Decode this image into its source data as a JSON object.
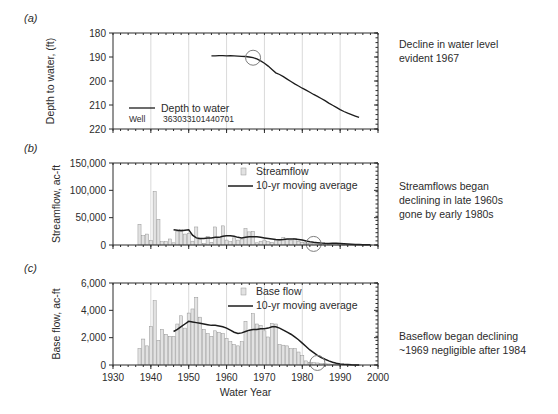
{
  "figure": {
    "panel_labels": {
      "a": "(a)",
      "b": "(b)",
      "c": "(c)"
    },
    "xlabel": "Water Year"
  },
  "annotations": {
    "a_line1": "Decline in water level",
    "a_line2": "evident 1967",
    "b_line1": "Streamflows began",
    "b_line2": "declining in late 1960s",
    "b_line3": "gone by early 1980s",
    "c_line1": "Baseflow began declining",
    "c_line2": "~1969 negligible after 1984"
  },
  "legends": {
    "a_series": "Depth to water",
    "a_well_label": "Well",
    "a_well_id": "363033101440701",
    "b_bars": "Streamflow",
    "b_line": "10-yr moving average",
    "c_bars": "Base flow",
    "c_line": "10-yr moving average"
  },
  "colors": {
    "bar_fill": "#e2e2e2",
    "bar_stroke": "#8d8d8d",
    "line": "#1d1d1d",
    "grid": "#c9c9c9",
    "marker_circle": "#7e7e7e"
  },
  "chart_data": [
    {
      "id": "panel-a",
      "type": "line",
      "title": "",
      "xlabel": "Water Year",
      "ylabel": "Depth to water, (ft)",
      "xlim": [
        1930,
        2000
      ],
      "ylim": [
        180,
        220
      ],
      "y_inverted": true,
      "xticks": [
        1930,
        1940,
        1950,
        1960,
        1970,
        1980,
        1990,
        2000
      ],
      "yticks": [
        180,
        190,
        200,
        210,
        220
      ],
      "grid": "vertical",
      "legend": "inside-lower-left",
      "marker_circle_x": 1967,
      "marker_circle_y": 190.3,
      "series": [
        {
          "name": "Depth to water",
          "x": [
            1956,
            1957,
            1958,
            1959,
            1960,
            1961,
            1962,
            1963,
            1964,
            1965,
            1966,
            1967,
            1968,
            1969,
            1970,
            1971,
            1972,
            1973,
            1974,
            1975,
            1976,
            1977,
            1978,
            1979,
            1980,
            1981,
            1982,
            1983,
            1984,
            1985,
            1986,
            1987,
            1988,
            1989,
            1990,
            1991,
            1992,
            1993,
            1994,
            1995
          ],
          "values": [
            189.5,
            189.5,
            189.4,
            189.4,
            189.5,
            189.4,
            189.5,
            189.6,
            189.7,
            189.8,
            190.0,
            190.3,
            190.8,
            191.6,
            192.6,
            193.8,
            195.2,
            196.6,
            197.3,
            198.2,
            199.2,
            200.2,
            201.2,
            202.1,
            203.0,
            203.8,
            204.7,
            205.6,
            206.4,
            207.3,
            208.2,
            209.2,
            210.1,
            211.0,
            211.9,
            212.7,
            213.4,
            214.0,
            214.6,
            215.2
          ]
        }
      ]
    },
    {
      "id": "panel-b",
      "type": "bar",
      "title": "",
      "xlabel": "Water Year",
      "ylabel": "Streamflow, ac-ft",
      "xlim": [
        1930,
        2000
      ],
      "ylim": [
        0,
        150000
      ],
      "xticks": [
        1930,
        1940,
        1950,
        1960,
        1970,
        1980,
        1990,
        2000
      ],
      "yticks": [
        0,
        50000,
        100000,
        150000
      ],
      "grid": "vertical",
      "legend": "inside-upper-right",
      "marker_circle_x": 1983,
      "marker_circle_y": 2000,
      "categories": [
        1937,
        1938,
        1939,
        1940,
        1941,
        1942,
        1943,
        1944,
        1945,
        1946,
        1947,
        1948,
        1949,
        1950,
        1951,
        1952,
        1953,
        1954,
        1955,
        1956,
        1957,
        1958,
        1959,
        1960,
        1961,
        1962,
        1963,
        1964,
        1965,
        1966,
        1967,
        1968,
        1969,
        1970,
        1971,
        1972,
        1973,
        1974,
        1975,
        1976,
        1977,
        1978,
        1979,
        1980,
        1981,
        1982,
        1983,
        1984,
        1985,
        1986,
        1987,
        1988,
        1989,
        1990,
        1991,
        1992,
        1993,
        1994,
        1995,
        1996,
        1997,
        1998
      ],
      "values": [
        38000,
        17000,
        20000,
        8000,
        98000,
        47000,
        6000,
        6000,
        11000,
        4000,
        25000,
        28000,
        20000,
        21000,
        7000,
        33000,
        10000,
        3000,
        16000,
        5000,
        33000,
        14000,
        35000,
        9000,
        6000,
        13000,
        9000,
        11000,
        30000,
        24000,
        25000,
        4000,
        7000,
        9000,
        6000,
        5000,
        9000,
        8000,
        14000,
        10000,
        9000,
        12000,
        6000,
        5000,
        4000,
        3000,
        2500,
        2000,
        1500,
        1200,
        1000,
        900,
        800,
        700,
        600,
        500,
        400,
        300,
        250,
        200,
        150,
        100
      ],
      "series": [
        {
          "name": "10-yr moving average",
          "x": [
            1946,
            1947,
            1948,
            1949,
            1950,
            1951,
            1952,
            1953,
            1954,
            1955,
            1956,
            1957,
            1958,
            1959,
            1960,
            1961,
            1962,
            1963,
            1964,
            1965,
            1966,
            1967,
            1968,
            1969,
            1970,
            1971,
            1972,
            1973,
            1974,
            1975,
            1976,
            1977,
            1978,
            1979,
            1980,
            1981,
            1982,
            1983,
            1984,
            1985,
            1986,
            1987,
            1988,
            1989,
            1990,
            1991,
            1992,
            1993,
            1994,
            1995,
            1996,
            1997,
            1998
          ],
          "values": [
            28000,
            27000,
            26000,
            27000,
            28000,
            18000,
            13000,
            12000,
            12000,
            13000,
            13000,
            14000,
            14000,
            16000,
            17000,
            17000,
            16000,
            14000,
            13000,
            14000,
            15000,
            15000,
            15000,
            14000,
            13000,
            12000,
            11000,
            10000,
            9500,
            10000,
            11000,
            11000,
            11000,
            10000,
            9000,
            7500,
            6000,
            5000,
            4200,
            3500,
            3000,
            2800,
            3000,
            3000,
            2800,
            2300,
            1800,
            1400,
            1000,
            700,
            500,
            400,
            300
          ]
        }
      ]
    },
    {
      "id": "panel-c",
      "type": "bar",
      "title": "",
      "xlabel": "Water Year",
      "ylabel": "Base flow, ac-ft",
      "xlim": [
        1930,
        2000
      ],
      "ylim": [
        0,
        6000
      ],
      "xticks": [
        1930,
        1940,
        1950,
        1960,
        1970,
        1980,
        1990,
        2000
      ],
      "yticks": [
        0,
        2000,
        4000,
        6000
      ],
      "grid": "vertical",
      "legend": "inside-upper-right",
      "marker_circle_x": 1984,
      "marker_circle_y": 150,
      "categories": [
        1937,
        1938,
        1939,
        1940,
        1941,
        1942,
        1943,
        1944,
        1945,
        1946,
        1947,
        1948,
        1949,
        1950,
        1951,
        1952,
        1953,
        1954,
        1955,
        1956,
        1957,
        1958,
        1959,
        1960,
        1961,
        1962,
        1963,
        1964,
        1965,
        1966,
        1967,
        1968,
        1969,
        1970,
        1971,
        1972,
        1973,
        1974,
        1975,
        1976,
        1977,
        1978,
        1979,
        1980,
        1981,
        1982,
        1983,
        1984,
        1985,
        1986,
        1987,
        1988,
        1989,
        1990,
        1991,
        1992,
        1993,
        1994,
        1995
      ],
      "values": [
        1200,
        1900,
        1400,
        2800,
        4700,
        1800,
        2600,
        2250,
        2100,
        2100,
        3000,
        3600,
        2700,
        3800,
        4100,
        4950,
        3500,
        2600,
        2300,
        2100,
        2500,
        2400,
        2300,
        1950,
        1700,
        1500,
        1400,
        1700,
        3200,
        2500,
        3750,
        3000,
        2900,
        2500,
        2050,
        3050,
        3000,
        1500,
        1450,
        1400,
        1200,
        1200,
        950,
        700,
        300,
        200,
        180,
        150,
        120,
        100,
        80,
        60,
        50,
        40,
        30,
        20,
        15,
        10,
        5
      ],
      "series": [
        {
          "name": "10-yr moving average",
          "x": [
            1946,
            1947,
            1948,
            1949,
            1950,
            1951,
            1952,
            1953,
            1954,
            1955,
            1956,
            1957,
            1958,
            1959,
            1960,
            1961,
            1962,
            1963,
            1964,
            1965,
            1966,
            1967,
            1968,
            1969,
            1970,
            1971,
            1972,
            1973,
            1974,
            1975,
            1976,
            1977,
            1978,
            1979,
            1980,
            1981,
            1982,
            1983,
            1984,
            1985,
            1986,
            1987,
            1988,
            1989,
            1990,
            1991,
            1992,
            1993,
            1994,
            1995
          ],
          "values": [
            2450,
            2600,
            2800,
            3000,
            3200,
            3150,
            3100,
            3050,
            3000,
            2950,
            2900,
            2900,
            2850,
            2800,
            2700,
            2550,
            2400,
            2300,
            2350,
            2450,
            2550,
            2600,
            2600,
            2650,
            2650,
            2700,
            2800,
            2800,
            2700,
            2550,
            2400,
            2250,
            2050,
            1850,
            1600,
            1350,
            1100,
            900,
            700,
            550,
            420,
            300,
            200,
            130,
            80,
            50,
            30,
            15,
            8,
            4
          ]
        }
      ]
    }
  ]
}
